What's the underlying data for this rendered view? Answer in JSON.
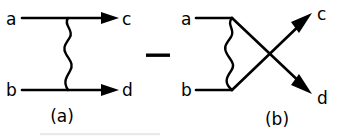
{
  "figure": {
    "kind": "feynman-diagram-pair",
    "background_color": "#ffffff",
    "ink_color": "#000000",
    "operator": {
      "symbol": "—",
      "name": "minus-sign",
      "x": 158,
      "y": 55,
      "width": 24,
      "height": 3.5
    },
    "diagrams": [
      {
        "id": "a",
        "caption": "(a)",
        "caption_x": 62,
        "caption_y": 122,
        "topology": "t-channel",
        "labels": {
          "in_upper": "a",
          "in_lower": "b",
          "out_upper": "c",
          "out_lower": "d"
        },
        "label_positions": {
          "in_upper": {
            "x": 6,
            "y": 25
          },
          "in_lower": {
            "x": 6,
            "y": 96
          },
          "out_upper": {
            "x": 122,
            "y": 25
          },
          "out_lower": {
            "x": 122,
            "y": 96
          }
        },
        "fermion_lines": [
          {
            "name": "a-to-c",
            "x1": 22,
            "y1": 18,
            "x2": 118,
            "y2": 18,
            "arrow_at": 118
          },
          {
            "name": "b-to-d",
            "x1": 22,
            "y1": 90,
            "x2": 118,
            "y2": 90,
            "arrow_at": 118
          }
        ],
        "boson_line": {
          "name": "wavy-exchange",
          "x": 68,
          "y1": 18,
          "y2": 90,
          "oscillations": 3.5,
          "amplitude": 5
        }
      },
      {
        "id": "b",
        "caption": "(b)",
        "caption_x": 277,
        "caption_y": 125,
        "topology": "u-channel-crossed",
        "labels": {
          "in_upper": "a",
          "in_lower": "b",
          "out_upper": "c",
          "out_lower": "d"
        },
        "label_positions": {
          "in_upper": {
            "x": 183,
            "y": 25
          },
          "in_lower": {
            "x": 183,
            "y": 96
          },
          "out_upper": {
            "x": 318,
            "y": 21
          },
          "out_lower": {
            "x": 318,
            "y": 103
          }
        },
        "fermion_lines": [
          {
            "name": "a-in-stub",
            "x1": 196,
            "y1": 18,
            "x2": 232,
            "y2": 18
          },
          {
            "name": "b-in-stub",
            "x1": 196,
            "y1": 90,
            "x2": 232,
            "y2": 90
          },
          {
            "name": "b-vertex-to-c",
            "x1": 232,
            "y1": 90,
            "x2": 311,
            "y2": 15,
            "arrow_at_end": true
          },
          {
            "name": "a-vertex-to-d",
            "x1": 232,
            "y1": 18,
            "x2": 311,
            "y2": 92,
            "arrow_at_end": true
          }
        ],
        "boson_line": {
          "name": "wavy-exchange",
          "x": 232,
          "y1": 18,
          "y2": 90,
          "oscillations": 3.5,
          "amplitude": 5,
          "bulge": "left"
        }
      }
    ]
  }
}
